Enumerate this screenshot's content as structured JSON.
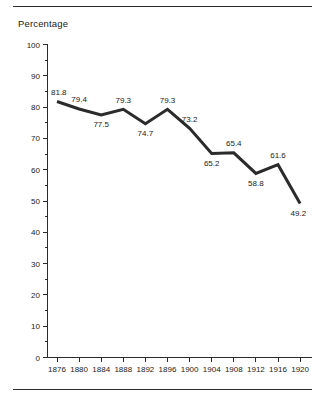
{
  "figure": {
    "top_rule": "horizontal-rule",
    "bottom_rule": "horizontal-rule"
  },
  "chart_data": {
    "type": "line",
    "title": "",
    "ylabel": "Percentage",
    "xlabel": "",
    "categories": [
      "1876",
      "1880",
      "1884",
      "1888",
      "1892",
      "1896",
      "1900",
      "1904",
      "1908",
      "1912",
      "1916",
      "1920"
    ],
    "values": [
      81.8,
      79.4,
      77.5,
      79.3,
      74.7,
      79.3,
      73.2,
      65.2,
      65.4,
      58.8,
      61.6,
      49.2
    ],
    "data_labels": [
      "81.8",
      "79.4",
      "77.5",
      "79.3",
      "74.7",
      "79.3",
      "73.2",
      "65.2",
      "65.4",
      "58.8",
      "61.6",
      "49.2"
    ],
    "label_positions": [
      "above",
      "above",
      "below",
      "above",
      "below",
      "above",
      "above",
      "below",
      "above",
      "below",
      "above",
      "below"
    ],
    "ylim": [
      0,
      100
    ],
    "ytick_labels": [
      "0",
      "10",
      "20",
      "30",
      "40",
      "50",
      "60",
      "70",
      "80",
      "90",
      "100"
    ],
    "ytick_values": [
      0,
      10,
      20,
      30,
      40,
      50,
      60,
      70,
      80,
      90,
      100
    ],
    "yminor_values": [
      5,
      15,
      25,
      35,
      45,
      55,
      65,
      75,
      85,
      95
    ],
    "grid": false,
    "legend": null,
    "line_color": "#2b2b2b",
    "line_width": 3
  }
}
